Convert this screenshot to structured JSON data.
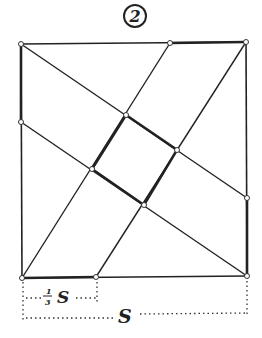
{
  "figure": {
    "number_label": "2",
    "labels": {
      "third_side": "S",
      "third_fraction_num": "1",
      "third_fraction_den": "3",
      "full_side": "S"
    },
    "colors": {
      "ink": "#222222",
      "background": "#ffffff"
    },
    "outer_square": {
      "corners": [
        [
          21,
          44
        ],
        [
          246,
          42
        ],
        [
          247,
          276
        ],
        [
          22,
          278
        ]
      ]
    },
    "division_points": {
      "top": [
        170,
        43
      ],
      "right": [
        247,
        198
      ],
      "bottom": [
        96,
        277
      ],
      "left": [
        21,
        122
      ]
    },
    "inner_square": {
      "vertices": [
        [
          126,
          115
        ],
        [
          177,
          150
        ],
        [
          144,
          205
        ],
        [
          92,
          169
        ]
      ]
    }
  }
}
